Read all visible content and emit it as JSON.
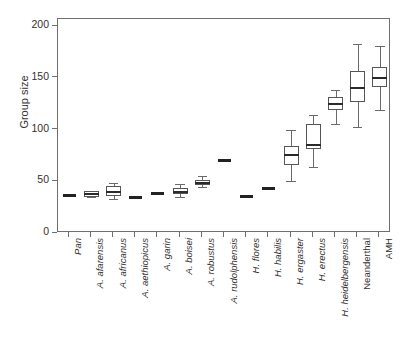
{
  "chart_data": {
    "type": "box",
    "title": "",
    "xlabel": "",
    "ylabel": "Group size",
    "ylim": [
      0,
      210
    ],
    "yticks": [
      0,
      50,
      100,
      150,
      200
    ],
    "ytick_labels": [
      "0",
      "50",
      "100",
      "150",
      "200"
    ],
    "grid": false,
    "legend": "none",
    "categories": [
      "Pan",
      "A. afarensis",
      "A. africanus",
      "A. aethiopicus",
      "A. garin",
      "A. boisei",
      "A. robustus",
      "A. rudolphensis",
      "H. flores",
      "H. habilis",
      "H. ergaster",
      "H. erectus",
      "H. heidelbergensis",
      "Neanderthal",
      "AMH"
    ],
    "category_styles": [
      "italic",
      "italic",
      "italic",
      "italic",
      "italic",
      "italic",
      "italic",
      "italic",
      "italic",
      "italic",
      "italic",
      "italic",
      "italic",
      "upright",
      "upright"
    ],
    "boxes": [
      {
        "label": "Pan",
        "whisker_low": 35,
        "q1": 35,
        "median": 36,
        "q3": 37,
        "whisker_high": 37,
        "style": "flat"
      },
      {
        "label": "A. afarensis",
        "whisker_low": 35,
        "q1": 35,
        "median": 38,
        "q3": 41,
        "whisker_high": 41,
        "style": "box"
      },
      {
        "label": "A. africanus",
        "whisker_low": 33,
        "q1": 36,
        "median": 40,
        "q3": 45,
        "whisker_high": 48,
        "style": "box"
      },
      {
        "label": "A. aethiopicus",
        "whisker_low": 33,
        "q1": 33,
        "median": 34,
        "q3": 35,
        "whisker_high": 35,
        "style": "flat"
      },
      {
        "label": "A. garin",
        "whisker_low": 37,
        "q1": 37,
        "median": 38,
        "q3": 39,
        "whisker_high": 39,
        "style": "flat"
      },
      {
        "label": "A. boisei",
        "whisker_low": 35,
        "q1": 38,
        "median": 40,
        "q3": 43,
        "whisker_high": 47,
        "style": "box"
      },
      {
        "label": "A. robustus",
        "whisker_low": 44,
        "q1": 46,
        "median": 48,
        "q3": 51,
        "whisker_high": 55,
        "style": "box"
      },
      {
        "label": "A. rudolphensis",
        "whisker_low": 69,
        "q1": 69,
        "median": 70,
        "q3": 71,
        "whisker_high": 71,
        "style": "flat"
      },
      {
        "label": "H. flores",
        "whisker_low": 34,
        "q1": 34,
        "median": 35,
        "q3": 36,
        "whisker_high": 36,
        "style": "flat"
      },
      {
        "label": "H. habilis",
        "whisker_low": 42,
        "q1": 42,
        "median": 43,
        "q3": 44,
        "whisker_high": 44,
        "style": "flat"
      },
      {
        "label": "H. ergaster",
        "whisker_low": 50,
        "q1": 66,
        "median": 75,
        "q3": 84,
        "whisker_high": 100,
        "style": "box"
      },
      {
        "label": "H. erectus",
        "whisker_low": 64,
        "q1": 81,
        "median": 85,
        "q3": 105,
        "whisker_high": 114,
        "style": "box"
      },
      {
        "label": "H. heidelbergensis",
        "whisker_low": 105,
        "q1": 119,
        "median": 125,
        "q3": 131,
        "whisker_high": 138,
        "style": "box"
      },
      {
        "label": "Neanderthal",
        "whisker_low": 102,
        "q1": 127,
        "median": 140,
        "q3": 157,
        "whisker_high": 183,
        "style": "box"
      },
      {
        "label": "AMH",
        "whisker_low": 119,
        "q1": 141,
        "median": 150,
        "q3": 160,
        "whisker_high": 181,
        "style": "box"
      }
    ]
  },
  "colors": {
    "axis": "#6f6f6f",
    "box_stroke": "#555555",
    "median": "#2a2a2a",
    "whisker": "#6a6a6a",
    "text": "#33302f",
    "background": "#ffffff"
  }
}
